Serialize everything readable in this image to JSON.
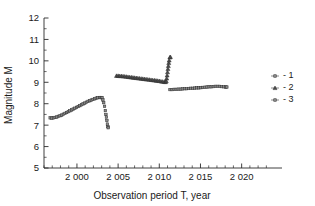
{
  "chart_data": {
    "type": "scatter",
    "title": "",
    "xlabel": "Observation period T, year",
    "ylabel": "Magnitude M",
    "xlim": [
      1996.0,
      2023.2
    ],
    "ylim": [
      5,
      12
    ],
    "xticks": [
      2000,
      2005,
      2010,
      2015,
      2020
    ],
    "xticklabels": [
      "2 000",
      "2 005",
      "2 010",
      "2 015",
      "2 020"
    ],
    "xminor_step": 1,
    "yticks": [
      5,
      6,
      7,
      8,
      9,
      10,
      11,
      12
    ],
    "yticklabels": [
      "5",
      "6",
      "7",
      "8",
      "9",
      "10",
      "11",
      "12"
    ],
    "yminor_step": 0.5,
    "grid": false,
    "legend_position": "right",
    "series": [
      {
        "name": "- 1",
        "legend_label": "- 1",
        "marker": "square",
        "color": "#8a8a8a",
        "points": [
          [
            1996.75,
            7.34
          ],
          [
            1996.95,
            7.33
          ],
          [
            1997.15,
            7.34
          ],
          [
            1997.35,
            7.36
          ],
          [
            1997.55,
            7.38
          ],
          [
            1997.75,
            7.41
          ],
          [
            1997.95,
            7.44
          ],
          [
            1998.15,
            7.47
          ],
          [
            1998.35,
            7.51
          ],
          [
            1998.55,
            7.55
          ],
          [
            1998.75,
            7.59
          ],
          [
            1998.95,
            7.63
          ],
          [
            1999.15,
            7.67
          ],
          [
            1999.35,
            7.71
          ],
          [
            1999.55,
            7.75
          ],
          [
            1999.75,
            7.79
          ],
          [
            1999.95,
            7.83
          ],
          [
            2000.15,
            7.87
          ],
          [
            2000.35,
            7.91
          ],
          [
            2000.55,
            7.95
          ],
          [
            2000.75,
            7.99
          ],
          [
            2000.95,
            8.03
          ],
          [
            2001.15,
            8.07
          ],
          [
            2001.35,
            8.11
          ],
          [
            2001.55,
            8.14
          ],
          [
            2001.75,
            8.17
          ],
          [
            2001.95,
            8.2
          ],
          [
            2002.15,
            8.23
          ],
          [
            2002.35,
            8.26
          ],
          [
            2002.55,
            8.28
          ],
          [
            2002.75,
            8.29
          ],
          [
            2002.95,
            8.29
          ],
          [
            2003.05,
            8.27
          ],
          [
            2003.15,
            8.18
          ],
          [
            2003.25,
            8.05
          ],
          [
            2003.35,
            7.88
          ],
          [
            2003.45,
            7.68
          ],
          [
            2003.52,
            7.5
          ],
          [
            2003.58,
            7.38
          ],
          [
            2003.64,
            7.22
          ],
          [
            2003.7,
            7.05
          ],
          [
            2003.76,
            6.93
          ],
          [
            2003.8,
            6.88
          ]
        ]
      },
      {
        "name": "- 2",
        "legend_label": "- 2",
        "marker": "triangle",
        "color": "#4a4a4a",
        "points": [
          [
            2004.8,
            9.3
          ],
          [
            2005.0,
            9.3
          ],
          [
            2005.2,
            9.29
          ],
          [
            2005.4,
            9.29
          ],
          [
            2005.6,
            9.28
          ],
          [
            2005.8,
            9.27
          ],
          [
            2006.0,
            9.26
          ],
          [
            2006.2,
            9.25
          ],
          [
            2006.4,
            9.24
          ],
          [
            2006.6,
            9.23
          ],
          [
            2006.8,
            9.22
          ],
          [
            2007.0,
            9.21
          ],
          [
            2007.2,
            9.2
          ],
          [
            2007.4,
            9.19
          ],
          [
            2007.6,
            9.18
          ],
          [
            2007.8,
            9.17
          ],
          [
            2008.0,
            9.16
          ],
          [
            2008.2,
            9.15
          ],
          [
            2008.4,
            9.14
          ],
          [
            2008.6,
            9.13
          ],
          [
            2008.8,
            9.12
          ],
          [
            2009.0,
            9.11
          ],
          [
            2009.2,
            9.1
          ],
          [
            2009.4,
            9.09
          ],
          [
            2009.6,
            9.08
          ],
          [
            2009.8,
            9.07
          ],
          [
            2010.0,
            9.06
          ],
          [
            2010.2,
            9.04
          ],
          [
            2010.4,
            9.03
          ],
          [
            2010.6,
            9.02
          ],
          [
            2010.75,
            9.01
          ],
          [
            2010.85,
            9.05
          ],
          [
            2010.9,
            9.18
          ],
          [
            2010.95,
            9.32
          ],
          [
            2011.0,
            9.47
          ],
          [
            2011.05,
            9.62
          ],
          [
            2011.1,
            9.76
          ],
          [
            2011.15,
            9.9
          ],
          [
            2011.2,
            10.02
          ],
          [
            2011.28,
            10.16
          ],
          [
            2011.35,
            10.18
          ]
        ]
      },
      {
        "name": "- 3",
        "legend_label": "- 3",
        "marker": "square",
        "color": "#8a8a8a",
        "points": [
          [
            2011.3,
            8.66
          ],
          [
            2011.55,
            8.66
          ],
          [
            2011.8,
            8.67
          ],
          [
            2012.05,
            8.67
          ],
          [
            2012.3,
            8.68
          ],
          [
            2012.55,
            8.68
          ],
          [
            2012.8,
            8.69
          ],
          [
            2013.05,
            8.7
          ],
          [
            2013.3,
            8.7
          ],
          [
            2013.55,
            8.71
          ],
          [
            2013.8,
            8.72
          ],
          [
            2014.05,
            8.72
          ],
          [
            2014.3,
            8.73
          ],
          [
            2014.55,
            8.74
          ],
          [
            2014.8,
            8.74
          ],
          [
            2015.05,
            8.75
          ],
          [
            2015.3,
            8.76
          ],
          [
            2015.55,
            8.77
          ],
          [
            2015.8,
            8.78
          ],
          [
            2016.05,
            8.79
          ],
          [
            2016.3,
            8.79
          ],
          [
            2016.55,
            8.8
          ],
          [
            2016.8,
            8.81
          ],
          [
            2017.05,
            8.81
          ],
          [
            2017.3,
            8.81
          ],
          [
            2017.55,
            8.8
          ],
          [
            2017.8,
            8.79
          ],
          [
            2018.05,
            8.78
          ],
          [
            2018.2,
            8.78
          ]
        ]
      }
    ]
  },
  "legend": {
    "entries": [
      {
        "label": "- 1"
      },
      {
        "label": "- 2"
      },
      {
        "label": "- 3"
      }
    ]
  }
}
